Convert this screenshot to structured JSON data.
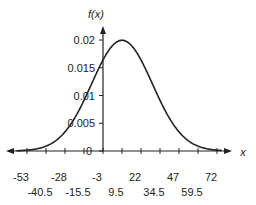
{
  "chart_data": {
    "type": "line",
    "title": "",
    "xlabel": "x",
    "ylabel": "f(x)",
    "distribution": "normal",
    "mean": 9.5,
    "sd": 20,
    "xlim": [
      -60,
      80
    ],
    "ylim": [
      0,
      0.022
    ],
    "x_ticks_row1": [
      "-53",
      "-28",
      "-3",
      "22",
      "47",
      "72"
    ],
    "x_ticks_row2": [
      "-40.5",
      "-15.5",
      "9.5",
      "34.5",
      "59.5"
    ],
    "x_tick_values": [
      -53,
      -40.5,
      -28,
      -15.5,
      -3,
      9.5,
      22,
      34.5,
      47,
      59.5,
      72
    ],
    "y_ticks": [
      "0",
      "0.005",
      "0.01",
      "0.015",
      "0.02"
    ],
    "y_tick_values": [
      0,
      0.005,
      0.01,
      0.015,
      0.02
    ],
    "grid": false,
    "legend": null,
    "series": [
      {
        "name": "f(x)",
        "x": [
          -53,
          -40.5,
          -28,
          -15.5,
          -3,
          9.5,
          22,
          34.5,
          47,
          59.5,
          72
        ],
        "values": [
          0.0001,
          0.0008,
          0.0035,
          0.0093,
          0.0164,
          0.0199,
          0.0164,
          0.0093,
          0.0035,
          0.0008,
          0.0001
        ]
      }
    ]
  },
  "labels": {
    "y_axis": "f(x)",
    "x_axis": "x",
    "origin": "0"
  }
}
